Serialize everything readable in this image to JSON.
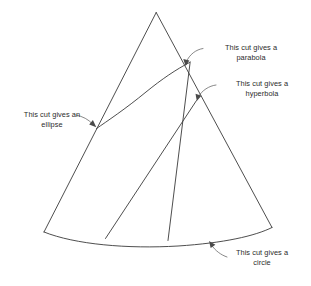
{
  "figure": {
    "shape": "cone",
    "line_color": "#3a3a3a",
    "text_color": "#2b2b2b",
    "background": "#ffffff"
  },
  "labels": {
    "parabola": "This cut gives a\nparabola",
    "hyperbola": "This cut gives a\nhyperbola",
    "ellipse": "This cut gives an\nellipse",
    "circle": "This cut gives a\ncircle"
  },
  "cuts": [
    {
      "name": "ellipse",
      "kind": "curve"
    },
    {
      "name": "parabola",
      "kind": "line"
    },
    {
      "name": "hyperbola",
      "kind": "line"
    },
    {
      "name": "circle",
      "kind": "arc"
    }
  ]
}
